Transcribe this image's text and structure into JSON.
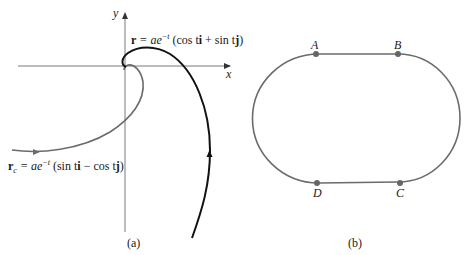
{
  "figure_a": {
    "caption": "(a)",
    "x_axis_label": "x",
    "y_axis_label": "y",
    "curve_r": {
      "label_bold": "r",
      "label_rest": " = ae",
      "label_exp": "−t",
      "label_tail_1": " (cos t",
      "label_i": "i",
      "label_tail_2": " + sin t",
      "label_j": "j",
      "label_tail_3": ")",
      "color": "#111111"
    },
    "curve_rc": {
      "label_bold": "r",
      "label_sub": "c",
      "label_rest": " = ae",
      "label_exp": "−t",
      "label_tail_1": " (sin t",
      "label_i": "i",
      "label_tail_2": " − cos t",
      "label_j": "j",
      "label_tail_3": ")",
      "color": "#6b6b6b"
    },
    "axis_color": "#7a7a7a"
  },
  "figure_b": {
    "caption": "(b)",
    "track_color": "#6b6b6b",
    "points": [
      {
        "label": "A"
      },
      {
        "label": "B"
      },
      {
        "label": "C"
      },
      {
        "label": "D"
      }
    ]
  }
}
